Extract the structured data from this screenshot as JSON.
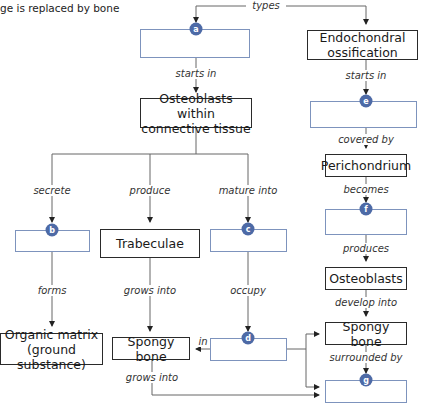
{
  "header": {
    "text": "ge is replaced by bone"
  },
  "top_label": "types",
  "nodes": {
    "a": {
      "badge": "a",
      "text": ""
    },
    "endochondral": {
      "text": "Endochondral ossification"
    },
    "osteoblasts_ct": {
      "text": "Osteoblasts within connective tissue"
    },
    "e": {
      "badge": "e",
      "text": ""
    },
    "perichondrium": {
      "text": "Perichondrium"
    },
    "b": {
      "badge": "b",
      "text": ""
    },
    "trabeculae": {
      "text": "Trabeculae"
    },
    "c": {
      "badge": "c",
      "text": ""
    },
    "f": {
      "badge": "f",
      "text": ""
    },
    "organic_matrix": {
      "text": "Organic matrix (ground substance)"
    },
    "spongy_left": {
      "text": "Spongy bone"
    },
    "d": {
      "badge": "d",
      "text": ""
    },
    "osteoblasts": {
      "text": "Osteoblasts"
    },
    "spongy_right": {
      "text": "Spongy bone"
    },
    "g": {
      "badge": "g",
      "text": ""
    }
  },
  "edges": {
    "a_starts_in": "starts in",
    "endo_starts_in": "starts in",
    "secrete": "secrete",
    "produce": "produce",
    "mature_into": "mature into",
    "covered_by": "covered by",
    "becomes": "becomes",
    "forms": "forms",
    "grows_into_1": "grows into",
    "occupy": "occupy",
    "produces": "produces",
    "in": "in",
    "develop_into": "develop into",
    "grows_into_2": "grows into",
    "surrounded_by": "surrounded by"
  },
  "colors": {
    "badge": "#4d6aa6",
    "blank_border": "#7d93bd",
    "filled_border": "#2a2a2a",
    "line": "#555555"
  }
}
